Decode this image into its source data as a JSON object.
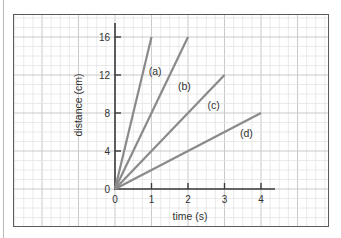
{
  "chart_data": {
    "type": "line",
    "title": "",
    "xlabel": "time (s)",
    "ylabel": "distance (cm)",
    "xlim": [
      0,
      4
    ],
    "ylim": [
      0,
      16
    ],
    "x_ticks": [
      0,
      1,
      2,
      3,
      4
    ],
    "y_ticks": [
      0,
      4,
      8,
      12,
      16
    ],
    "x_tick_labels": [
      "0",
      "1",
      "2",
      "3",
      "4"
    ],
    "y_tick_labels": [
      "0",
      "4",
      "8",
      "12",
      "16"
    ],
    "grid": true,
    "legend": "inline labels",
    "series": [
      {
        "name": "(a)",
        "x": [
          0,
          1
        ],
        "values": [
          0,
          16
        ],
        "label_pos": [
          1.1,
          12
        ]
      },
      {
        "name": "(b)",
        "x": [
          0,
          2
        ],
        "values": [
          0,
          16
        ],
        "label_pos": [
          1.9,
          10.4
        ]
      },
      {
        "name": "(c)",
        "x": [
          0,
          3
        ],
        "values": [
          0,
          12
        ],
        "label_pos": [
          2.7,
          8.4
        ]
      },
      {
        "name": "(d)",
        "x": [
          0,
          4
        ],
        "values": [
          0,
          8
        ],
        "label_pos": [
          3.6,
          5.5
        ]
      }
    ],
    "colors": {
      "line": "#8a8a8a",
      "axis": "#3a3a3a",
      "grid_major": "#c9c9c9",
      "grid_minor": "#e4e4e4",
      "frame": "#5a5a5a",
      "text": "#333333"
    }
  }
}
